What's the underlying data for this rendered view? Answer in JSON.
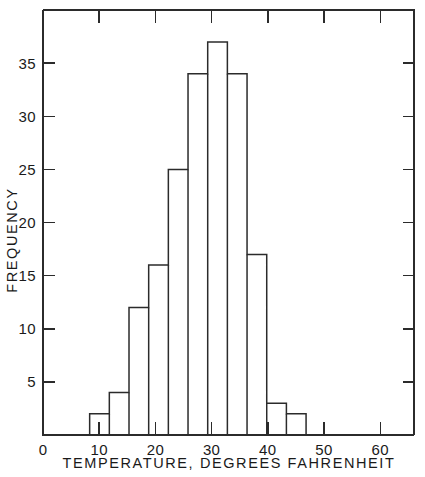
{
  "chart_data": {
    "type": "bar",
    "title": "",
    "subtitle": "",
    "xlabel": "TEMPERATURE, DEGREES FAHRENHEIT",
    "ylabel": "FREQUENCY",
    "xlim": [
      0,
      66
    ],
    "ylim": [
      0,
      40
    ],
    "grid": false,
    "legend": null,
    "x_ticks_major": [
      0,
      10,
      20,
      30,
      40,
      50,
      60
    ],
    "x_tick_labels": [
      "0",
      "10",
      "20",
      "30",
      "40",
      "50",
      "60"
    ],
    "x_ticks_minor": [
      5,
      15,
      25,
      35,
      45,
      55,
      65
    ],
    "y_ticks_major": [
      5,
      10,
      15,
      20,
      25,
      30,
      35
    ],
    "y_tick_labels": [
      "5",
      "10",
      "15",
      "20",
      "25",
      "30",
      "35"
    ],
    "bin_edges": [
      8.3,
      11.8,
      15.3,
      18.8,
      22.3,
      25.8,
      29.3,
      32.8,
      36.3,
      39.8,
      43.3,
      46.8
    ],
    "categories": [
      "8.3-11.8",
      "11.8-15.3",
      "15.3-18.8",
      "18.8-22.3",
      "22.3-25.8",
      "25.8-29.3",
      "29.3-32.8",
      "32.8-36.3",
      "36.3-39.8",
      "39.8-43.3",
      "43.3-46.8"
    ],
    "values": [
      2,
      4,
      12,
      16,
      25,
      34,
      37,
      34,
      17,
      3,
      2
    ],
    "annotations": []
  },
  "axes": {
    "x_axis_name": "temperature-axis",
    "y_axis_name": "frequency-axis"
  }
}
